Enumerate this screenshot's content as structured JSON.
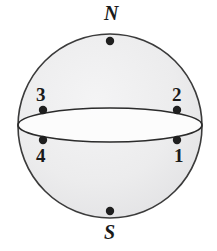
{
  "figure": {
    "background_color": "#ffffff",
    "sphere": {
      "fill_color": "#ececed",
      "stroke_color": "#3b3b3b",
      "center_x": 110,
      "center_y": 126,
      "radius": 92
    },
    "equator": {
      "semi_major_axis": 92,
      "semi_minor_axis": 17,
      "fill_color": "#fdfdfd",
      "stroke_color": "#2b2b2b"
    },
    "marker": {
      "color": "#1f1f1f",
      "radius": 4.2
    }
  },
  "points": [
    {
      "id": "north-pole",
      "label": "N",
      "label_kind": "pole",
      "x": 110,
      "y": 41,
      "label_x": 104,
      "label_y": 3
    },
    {
      "id": "point-3",
      "label": "3",
      "label_kind": "number",
      "x": 43,
      "y": 110,
      "label_x": 36,
      "label_y": 85
    },
    {
      "id": "point-2",
      "label": "2",
      "label_kind": "number",
      "x": 177,
      "y": 110,
      "label_x": 172,
      "label_y": 85
    },
    {
      "id": "point-4",
      "label": "4",
      "label_kind": "number",
      "x": 43,
      "y": 140,
      "label_x": 36,
      "label_y": 146
    },
    {
      "id": "point-1",
      "label": "1",
      "label_kind": "number",
      "x": 177,
      "y": 140,
      "label_x": 174,
      "label_y": 146
    },
    {
      "id": "south-pole",
      "label": "S",
      "label_kind": "pole",
      "x": 110,
      "y": 211,
      "label_x": 104,
      "label_y": 222
    }
  ]
}
